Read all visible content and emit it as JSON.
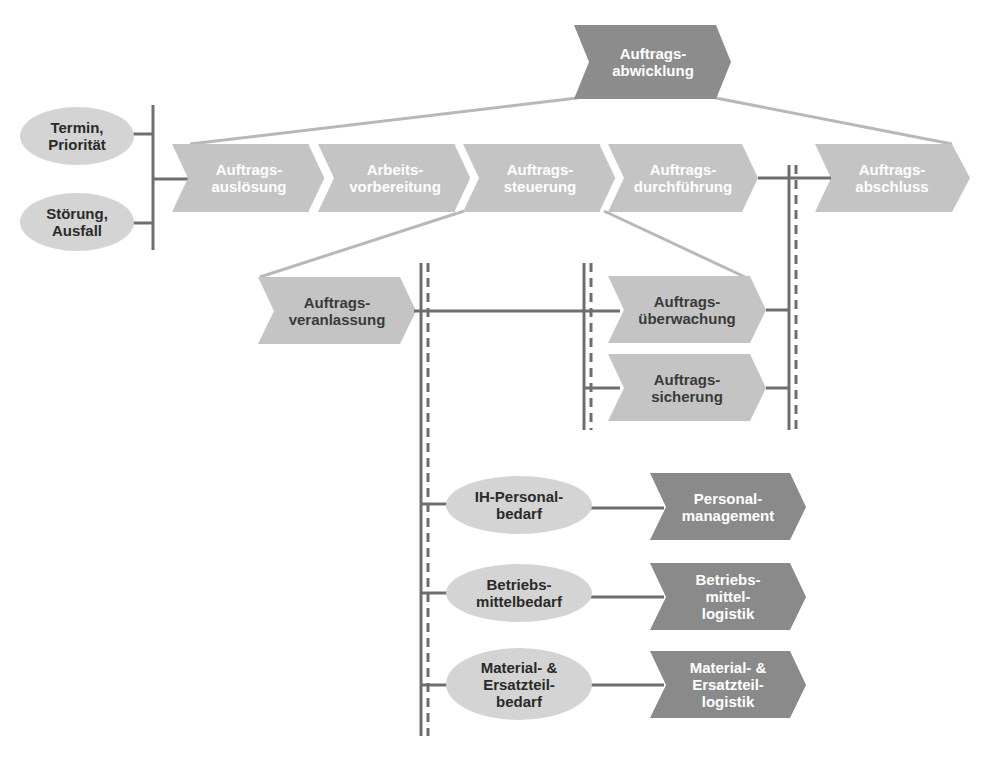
{
  "colors": {
    "chevron_light": "#c4c4c4",
    "chevron_dark": "#8a8a8a",
    "chevron_top": "#8c8c8c",
    "ellipse": "#d4d4d4",
    "line": "#6e6e6e",
    "connector": "#b8b8b8"
  },
  "top": {
    "label": "Auftrags-\nabwicklung"
  },
  "inputs": [
    {
      "label": "Termin,\nPriorität"
    },
    {
      "label": "Störung,\nAusfall"
    }
  ],
  "main_process": [
    {
      "label": "Auftrags-\nauslösung"
    },
    {
      "label": "Arbeits-\nvorbereitung"
    },
    {
      "label": "Auftrags-\nsteuerung"
    },
    {
      "label": "Auftrags-\ndurchführung"
    },
    {
      "label": "Auftrags-\nabschluss"
    }
  ],
  "sub_process": [
    {
      "label": "Auftrags-\nveranlassung"
    },
    {
      "label": "Auftrags-\nüberwachung"
    },
    {
      "label": "Auftrags-\nsicherung"
    }
  ],
  "requirements": [
    {
      "label": "IH-Personal-\nbedarf"
    },
    {
      "label": "Betriebs-\nmittelbedarf"
    },
    {
      "label": "Material- &\nErsatzteil-\nbedarf"
    }
  ],
  "logistics": [
    {
      "label": "Personal-\nmanagement"
    },
    {
      "label": "Betriebs-\nmittel-\nlogistik"
    },
    {
      "label": "Material- &\nErsatzteil-\nlogistik"
    }
  ]
}
